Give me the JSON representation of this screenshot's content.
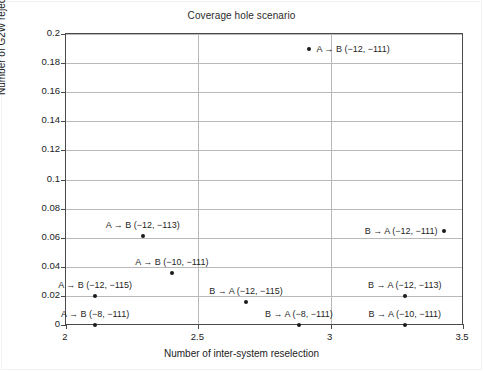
{
  "chart_data": {
    "type": "scatter",
    "title": "Coverage hole scenario",
    "xlabel": "Number of inter-system reselection",
    "ylabel": "Number of G2W rejects",
    "xlim": [
      2,
      3.5
    ],
    "ylim": [
      0,
      0.2
    ],
    "xticks": [
      "2",
      "2.5",
      "3",
      "3.5"
    ],
    "xtick_values": [
      2,
      2.5,
      3,
      3.5
    ],
    "yticks": [
      "0",
      "0.02",
      "0.04",
      "0.06",
      "0.08",
      "0.1",
      "0.12",
      "0.14",
      "0.16",
      "0.18",
      "0.2"
    ],
    "ytick_values": [
      0,
      0.02,
      0.04,
      0.06,
      0.08,
      0.1,
      0.12,
      0.14,
      0.16,
      0.18,
      0.2
    ],
    "grid": true,
    "legend": "none",
    "points": [
      {
        "label": "A → B (−12, −111)",
        "x": 2.92,
        "y": 0.19,
        "label_pos": "right"
      },
      {
        "label": "B → A (−12, −111)",
        "x": 3.43,
        "y": 0.0645,
        "label_pos": "left"
      },
      {
        "label": "A → B (−12, −113)",
        "x": 2.29,
        "y": 0.061,
        "label_pos": "above"
      },
      {
        "label": "A → B (−10, −111)",
        "x": 2.4,
        "y": 0.0355,
        "label_pos": "above"
      },
      {
        "label": "B → A (−12, −115)",
        "x": 2.68,
        "y": 0.0155,
        "label_pos": "above"
      },
      {
        "label": "A → B (−12, −115)",
        "x": 2.11,
        "y": 0.02,
        "label_pos": "above"
      },
      {
        "label": "B → A (−12, −113)",
        "x": 3.28,
        "y": 0.02,
        "label_pos": "above"
      },
      {
        "label": "A → B (−8, −111)",
        "x": 2.11,
        "y": 0.0,
        "label_pos": "above"
      },
      {
        "label": "B → A (−8, −111)",
        "x": 2.88,
        "y": 0.0,
        "label_pos": "above"
      },
      {
        "label": "B → A (−10, −111)",
        "x": 3.28,
        "y": 0.0,
        "label_pos": "above"
      }
    ],
    "colors": {
      "marker": "#1b1b1b",
      "grid": "#b9b9b9",
      "frame": "#4a4a4a",
      "text": "#1f1f1f",
      "background": "#ffffff"
    }
  }
}
